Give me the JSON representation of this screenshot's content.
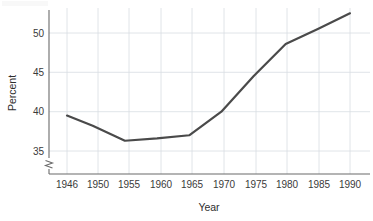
{
  "chart_data": {
    "type": "line",
    "title": "",
    "subtitle": "",
    "xlabel": "Year",
    "ylabel": "Percent",
    "x": [
      1946,
      1950,
      1955,
      1960,
      1965,
      1970,
      1975,
      1980,
      1985,
      1990
    ],
    "values": [
      39.5,
      38.2,
      36.3,
      36.6,
      37.0,
      40.0,
      44.5,
      48.6,
      50.5,
      52.5
    ],
    "series": [
      {
        "name": "Percent",
        "values": [
          39.5,
          38.2,
          36.3,
          36.6,
          37.0,
          40.0,
          44.5,
          48.6,
          50.5,
          52.5
        ]
      }
    ],
    "xticks": [
      "1946",
      "1950",
      "1955",
      "1960",
      "1965",
      "1970",
      "1975",
      "1980",
      "1985",
      "1990"
    ],
    "yticks": [
      "35",
      "40",
      "45",
      "50"
    ],
    "ytick_values": [
      35,
      40,
      45,
      50
    ],
    "xlim": [
      1944,
      1992
    ],
    "ylim": [
      35,
      53.5
    ],
    "grid": true,
    "legend": "none",
    "axis_break": true,
    "axis_break_note": "y-axis broken below 35",
    "line_color": "#4a4a4a",
    "grid_color": "#d8dde2",
    "axis_color": "#6b6b6b"
  },
  "axes": {
    "y_title": "Percent",
    "x_title": "Year"
  }
}
